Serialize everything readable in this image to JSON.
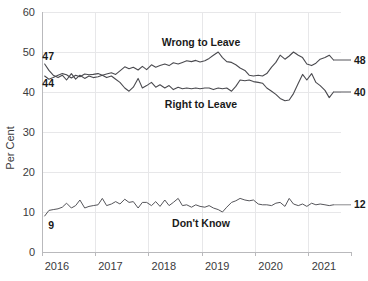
{
  "chart_data": {
    "type": "line",
    "title": "",
    "xlabel": "",
    "ylabel": "Per Cent",
    "ylim": [
      0,
      60
    ],
    "xlim": [
      2016.0,
      2021.6
    ],
    "grid": true,
    "legend_position": "inline-annotations",
    "y_ticks": [
      "0",
      "10",
      "20",
      "30",
      "40",
      "50",
      "60"
    ],
    "y_tick_values": [
      0,
      10,
      20,
      30,
      40,
      50,
      60
    ],
    "x_ticks": [
      "2016",
      "2017",
      "2018",
      "2019",
      "2020",
      "2021"
    ],
    "x_tick_values": [
      2016,
      2017,
      2018,
      2019,
      2020,
      2021
    ],
    "series": [
      {
        "name": "Wrong to Leave",
        "label": "Wrong to Leave",
        "color": "#55555a",
        "start_value": 44,
        "end_value": 48,
        "x": [
          2016.05,
          2016.13,
          2016.21,
          2016.3,
          2016.38,
          2016.46,
          2016.55,
          2016.63,
          2016.71,
          2016.8,
          2016.88,
          2016.96,
          2017.05,
          2017.13,
          2017.21,
          2017.3,
          2017.38,
          2017.46,
          2017.55,
          2017.63,
          2017.71,
          2017.8,
          2017.88,
          2017.96,
          2018.05,
          2018.13,
          2018.21,
          2018.3,
          2018.38,
          2018.46,
          2018.55,
          2018.63,
          2018.71,
          2018.8,
          2018.88,
          2018.96,
          2019.05,
          2019.13,
          2019.21,
          2019.3,
          2019.38,
          2019.46,
          2019.55,
          2019.63,
          2019.71,
          2019.8,
          2019.88,
          2019.96,
          2020.05,
          2020.13,
          2020.21,
          2020.3,
          2020.38,
          2020.46,
          2020.55,
          2020.63,
          2020.71,
          2020.8,
          2020.88,
          2020.96,
          2021.05,
          2021.13,
          2021.21,
          2021.3,
          2021.38,
          2021.46
        ],
        "values": [
          44,
          43.2,
          43.6,
          44.2,
          44.6,
          44.3,
          43.5,
          44.2,
          43.8,
          44.5,
          44.3,
          44.4,
          44.6,
          44.2,
          44.5,
          44.8,
          44.4,
          45.3,
          46.3,
          45.8,
          46.2,
          45.5,
          46.4,
          45.6,
          46.8,
          46.2,
          46.6,
          47.0,
          46.6,
          47.3,
          47.0,
          47.4,
          47.8,
          47.6,
          47.9,
          47.5,
          47.8,
          48.4,
          49.2,
          50.0,
          48.6,
          47.6,
          47.4,
          46.8,
          46.0,
          45.4,
          44.2,
          44.0,
          44.2,
          44.0,
          44.6,
          46.2,
          47.4,
          49.2,
          48.2,
          49.0,
          50.0,
          49.2,
          48.6,
          47.0,
          46.6,
          47.2,
          48.2,
          48.6,
          49.2,
          48.0
        ]
      },
      {
        "name": "Right to Leave",
        "label": "Right to Leave",
        "color": "#55555a",
        "start_value": 47,
        "end_value": 40,
        "x": [
          2016.05,
          2016.13,
          2016.21,
          2016.3,
          2016.38,
          2016.46,
          2016.55,
          2016.63,
          2016.71,
          2016.8,
          2016.88,
          2016.96,
          2017.05,
          2017.13,
          2017.21,
          2017.3,
          2017.38,
          2017.46,
          2017.55,
          2017.63,
          2017.71,
          2017.8,
          2017.88,
          2017.96,
          2018.05,
          2018.13,
          2018.21,
          2018.3,
          2018.38,
          2018.46,
          2018.55,
          2018.63,
          2018.71,
          2018.8,
          2018.88,
          2018.96,
          2019.05,
          2019.13,
          2019.21,
          2019.3,
          2019.38,
          2019.46,
          2019.55,
          2019.63,
          2019.71,
          2019.8,
          2019.88,
          2019.96,
          2020.05,
          2020.13,
          2020.21,
          2020.3,
          2020.38,
          2020.46,
          2020.55,
          2020.63,
          2020.71,
          2020.8,
          2020.88,
          2020.96,
          2021.05,
          2021.13,
          2021.21,
          2021.3,
          2021.38,
          2021.46
        ],
        "values": [
          47,
          45.4,
          44.2,
          43.6,
          44.2,
          43.0,
          44.6,
          43.2,
          44.2,
          43.4,
          44.0,
          43.6,
          43.8,
          44.2,
          43.6,
          44.0,
          43.2,
          42.4,
          41.0,
          40.2,
          41.2,
          43.4,
          41.0,
          41.6,
          42.4,
          41.2,
          41.8,
          41.0,
          41.6,
          40.6,
          41.2,
          40.8,
          41.0,
          40.8,
          41.0,
          40.8,
          41.0,
          41.0,
          40.6,
          41.0,
          40.8,
          41.0,
          40.2,
          41.4,
          43.0,
          42.8,
          43.0,
          42.6,
          42.4,
          42.2,
          41.0,
          40.2,
          39.4,
          38.4,
          37.8,
          38.0,
          39.6,
          42.2,
          44.4,
          43.0,
          44.6,
          42.4,
          41.6,
          40.4,
          38.6,
          40.0
        ]
      },
      {
        "name": "Don't Know",
        "label": "Don't Know",
        "color": "#8a8a8e",
        "start_value": 9,
        "end_value": 12,
        "x": [
          2016.05,
          2016.13,
          2016.21,
          2016.3,
          2016.38,
          2016.46,
          2016.55,
          2016.63,
          2016.71,
          2016.8,
          2016.88,
          2016.96,
          2017.05,
          2017.13,
          2017.21,
          2017.3,
          2017.38,
          2017.46,
          2017.55,
          2017.63,
          2017.71,
          2017.8,
          2017.88,
          2017.96,
          2018.05,
          2018.13,
          2018.21,
          2018.3,
          2018.38,
          2018.46,
          2018.55,
          2018.63,
          2018.71,
          2018.8,
          2018.88,
          2018.96,
          2019.05,
          2019.13,
          2019.21,
          2019.3,
          2019.38,
          2019.46,
          2019.55,
          2019.63,
          2019.71,
          2019.8,
          2019.88,
          2019.96,
          2020.05,
          2020.13,
          2020.21,
          2020.3,
          2020.38,
          2020.46,
          2020.55,
          2020.63,
          2020.71,
          2020.8,
          2020.88,
          2020.96,
          2021.05,
          2021.13,
          2021.21,
          2021.3,
          2021.38,
          2021.46
        ],
        "values": [
          9,
          10.4,
          10.6,
          10.8,
          11.2,
          12.2,
          11.0,
          11.6,
          13.0,
          11.0,
          11.4,
          11.6,
          11.8,
          13.4,
          11.6,
          12.0,
          12.6,
          12.0,
          13.2,
          12.4,
          12.6,
          11.0,
          12.4,
          12.4,
          11.6,
          12.6,
          11.4,
          13.0,
          11.6,
          12.4,
          13.4,
          11.6,
          11.8,
          11.2,
          11.8,
          11.4,
          11.2,
          11.6,
          11.0,
          10.6,
          10.0,
          11.2,
          12.4,
          12.8,
          13.4,
          13.0,
          12.8,
          13.0,
          12.0,
          11.8,
          11.8,
          11.6,
          12.2,
          12.4,
          11.4,
          13.4,
          12.0,
          11.6,
          12.0,
          11.4,
          12.2,
          11.8,
          12.0,
          11.8,
          11.6,
          11.8
        ]
      }
    ],
    "annotations": {
      "left_labels": [
        {
          "text": "47",
          "series": "Right to Leave",
          "value": 47
        },
        {
          "text": "44",
          "series": "Wrong to Leave",
          "value": 44
        },
        {
          "text": "9",
          "series": "Don't Know",
          "value": 9
        }
      ],
      "right_labels": [
        {
          "text": "48",
          "series": "Wrong to Leave",
          "value": 48
        },
        {
          "text": "40",
          "series": "Right to Leave",
          "value": 40
        },
        {
          "text": "12",
          "series": "Don't Know",
          "value": 12
        }
      ],
      "inline_series_labels": [
        {
          "text": "Wrong to Leave"
        },
        {
          "text": "Right to Leave"
        },
        {
          "text": "Don't Know"
        }
      ]
    }
  }
}
